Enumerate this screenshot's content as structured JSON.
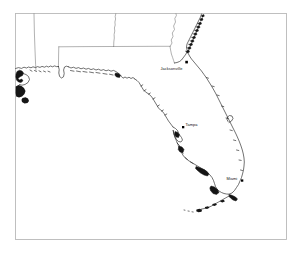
{
  "figure": {
    "kind": "outline-map",
    "region_title": "Florida and Southeastern United States",
    "background_color": "#ffffff",
    "frame_color": "#b9b9b9",
    "coastline_color": "#1a1a1a",
    "state_border_color": "#7d7d7d",
    "label_color": "#101010",
    "frame": {
      "x": 15,
      "y": 13,
      "width": 272,
      "height": 227
    }
  },
  "cities": [
    {
      "name": "Jacksonville",
      "label": "Jacksonville",
      "marker": "filled-square",
      "dot": {
        "x": 186.5,
        "y": 62.0,
        "r": 1.5
      },
      "label_pos": {
        "x": 160.5,
        "y": 70.4
      }
    },
    {
      "name": "Tampa",
      "label": "Tampa",
      "marker": "filled-square",
      "dot": {
        "x": 183.0,
        "y": 127.0,
        "r": 1.3
      },
      "label_pos": {
        "x": 185.0,
        "y": 126.0
      }
    },
    {
      "name": "Miami",
      "label": "Miami",
      "marker": "filled-square",
      "dot": {
        "x": 242.0,
        "y": 180.5,
        "r": 1.3
      },
      "label_pos": {
        "x": 226.0,
        "y": 180.0
      }
    }
  ],
  "features": {
    "water_bodies": [
      "Gulf of Mexico",
      "Atlantic Ocean",
      "Florida Straits"
    ],
    "land_areas": [
      "Florida Peninsula",
      "Florida Panhandle",
      "Florida Keys",
      "Georgia",
      "Alabama",
      "Mississippi",
      "Louisiana"
    ],
    "state_borders_visible": true,
    "graticule_visible": false,
    "legend_visible": false,
    "scale_bar_visible": false
  }
}
